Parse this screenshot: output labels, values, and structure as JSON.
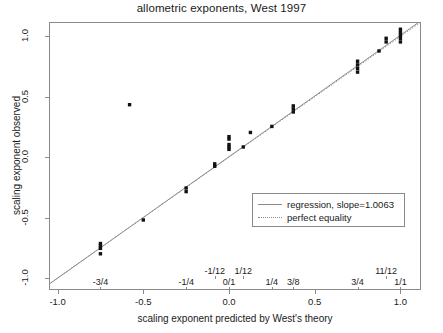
{
  "chart_data": {
    "type": "scatter",
    "title": "allometric exponents, West 1997",
    "xlabel": "scaling exponent predicted by West's theory",
    "ylabel": "scaling exponent observed",
    "xlim": [
      -1.05,
      1.12
    ],
    "ylim": [
      -1.1,
      1.12
    ],
    "grid": false,
    "x_ticks": [
      "-1.0",
      "-0.5",
      "0.0",
      "0.5",
      "1.0"
    ],
    "x_tick_values": [
      -1.0,
      -0.5,
      0.0,
      0.5,
      1.0
    ],
    "y_ticks": [
      "-1.0",
      "-0.5",
      "0.0",
      "0.5",
      "1.0"
    ],
    "y_tick_values": [
      -1.0,
      -0.5,
      0.0,
      0.5,
      1.0
    ],
    "x_fraction_ticks_lower": [
      {
        "label": "-3/4",
        "value": -0.75
      },
      {
        "label": "-1/4",
        "value": -0.25
      },
      {
        "label": "0/1",
        "value": 0.0
      },
      {
        "label": "1/4",
        "value": 0.25
      },
      {
        "label": "3/8",
        "value": 0.375
      },
      {
        "label": "3/4",
        "value": 0.75
      },
      {
        "label": "1/1",
        "value": 1.0
      }
    ],
    "x_fraction_ticks_upper": [
      {
        "label": "-1/12",
        "value": -0.0833
      },
      {
        "label": "1/12",
        "value": 0.0833
      },
      {
        "label": "11/12",
        "value": 0.9167
      }
    ],
    "legend": {
      "position": "bottom-right",
      "entries": [
        {
          "label": "regression, slope=1.0063",
          "style": "solid"
        },
        {
          "label": "perfect equality",
          "style": "dotted"
        }
      ]
    },
    "regression": {
      "slope": 1.0063,
      "intercept": 0.004
    },
    "equality": {
      "slope": 1.0,
      "intercept": 0.0
    },
    "points": [
      {
        "x": -0.75,
        "y": -0.8
      },
      {
        "x": -0.75,
        "y": -0.755
      },
      {
        "x": -0.75,
        "y": -0.735
      },
      {
        "x": -0.75,
        "y": -0.715
      },
      {
        "x": -0.5,
        "y": -0.52
      },
      {
        "x": -0.25,
        "y": -0.285
      },
      {
        "x": -0.25,
        "y": -0.255
      },
      {
        "x": -0.0833,
        "y": -0.075
      },
      {
        "x": -0.0833,
        "y": -0.055
      },
      {
        "x": 0.0,
        "y": 0.065
      },
      {
        "x": 0.0,
        "y": 0.085
      },
      {
        "x": 0.0,
        "y": 0.105
      },
      {
        "x": 0.0,
        "y": 0.15
      },
      {
        "x": 0.0,
        "y": 0.17
      },
      {
        "x": 0.0833,
        "y": 0.085
      },
      {
        "x": 0.125,
        "y": 0.205
      },
      {
        "x": 0.25,
        "y": 0.255
      },
      {
        "x": 0.375,
        "y": 0.375
      },
      {
        "x": 0.375,
        "y": 0.4
      },
      {
        "x": 0.375,
        "y": 0.425
      },
      {
        "x": 0.75,
        "y": 0.705
      },
      {
        "x": 0.75,
        "y": 0.735
      },
      {
        "x": 0.75,
        "y": 0.765
      },
      {
        "x": 0.75,
        "y": 0.795
      },
      {
        "x": 0.875,
        "y": 0.88
      },
      {
        "x": 0.9167,
        "y": 0.955
      },
      {
        "x": 0.9167,
        "y": 0.985
      },
      {
        "x": 1.0,
        "y": 0.955
      },
      {
        "x": 1.0,
        "y": 0.985
      },
      {
        "x": 1.0,
        "y": 1.01
      },
      {
        "x": 1.0,
        "y": 1.035
      },
      {
        "x": 1.0,
        "y": 1.06
      },
      {
        "x": -0.58,
        "y": 0.435
      }
    ]
  }
}
